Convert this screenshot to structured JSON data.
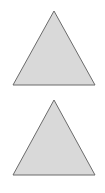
{
  "shapes": [
    {
      "type": "triangle",
      "points": "54,11 95,85 13,85",
      "fill": "#d9d9d9",
      "stroke": "#6b6b6b"
    },
    {
      "type": "triangle",
      "points": "54,100 95,175 13,175",
      "fill": "#d9d9d9",
      "stroke": "#6b6b6b"
    }
  ]
}
